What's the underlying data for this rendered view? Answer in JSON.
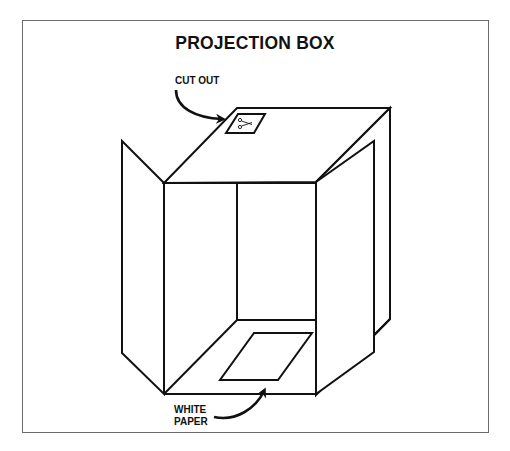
{
  "title": "PROJECTION BOX",
  "labels": {
    "cut_out": "CUT OUT",
    "white_paper_line1": "WHITE",
    "white_paper_line2": "PAPER"
  },
  "icons": {
    "scissors": "scissors-icon"
  },
  "colors": {
    "line": "#111111",
    "frame": "#6b6b6b",
    "background": "#ffffff"
  }
}
